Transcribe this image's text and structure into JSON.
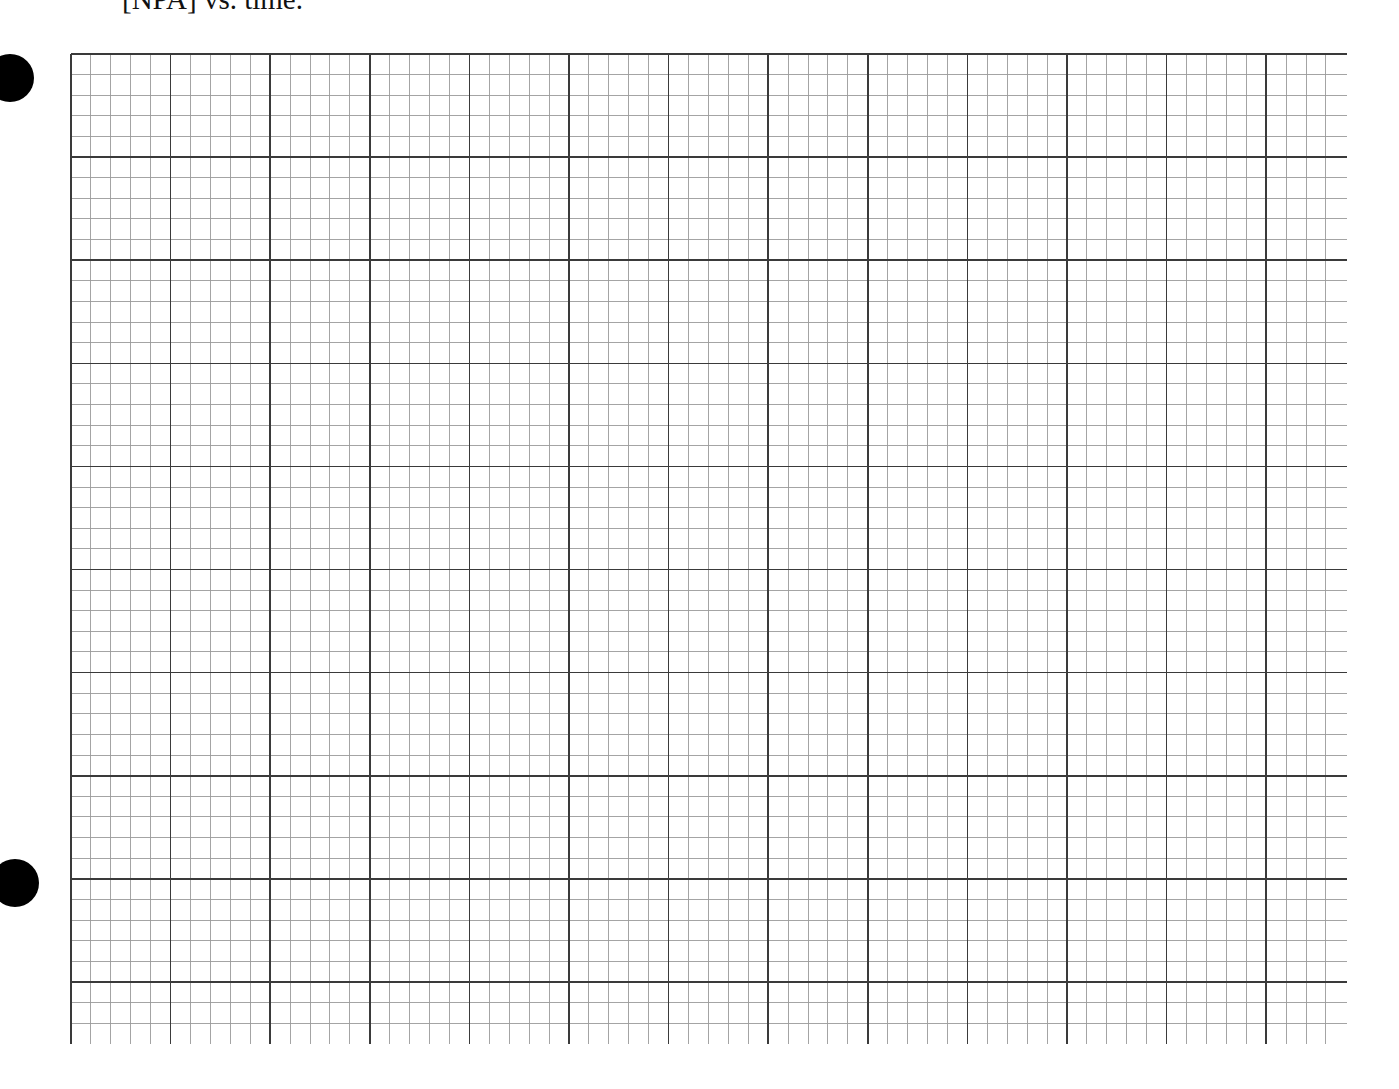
{
  "page": {
    "caption": "[NPA] vs. time."
  },
  "binder_holes": [
    {
      "cx": 10,
      "cy": 78,
      "r": 24
    },
    {
      "cx": 15,
      "cy": 883,
      "r": 24
    }
  ],
  "graph_paper": {
    "left": 71,
    "top": 54,
    "right": 1347,
    "bottom": 1044,
    "major_x_spacing": 99.6,
    "major_y_spacing": 103.1,
    "minor_divisions": 5,
    "major_columns": 12.8,
    "major_rows": 9.6,
    "major_line_color": "#3a3a3a",
    "minor_line_color": "#9a9a9a",
    "major_line_width": 1.6,
    "minor_line_width": 0.9,
    "plotted_data": []
  }
}
